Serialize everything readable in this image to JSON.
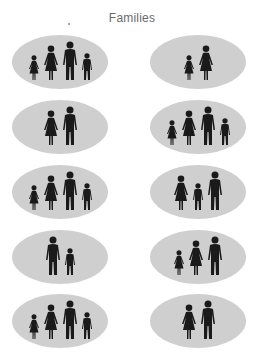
{
  "title": "Families",
  "colors": {
    "oval": "#cfcfcf",
    "figure": "#1a1a1a",
    "title": "#6a6a6a"
  },
  "families": [
    {
      "members": [
        "girl",
        "woman",
        "man",
        "boy"
      ]
    },
    {
      "members": [
        "girl",
        "woman"
      ]
    },
    {
      "members": [
        "woman",
        "man"
      ]
    },
    {
      "members": [
        "girl",
        "woman",
        "man",
        "boy"
      ]
    },
    {
      "members": [
        "girl",
        "woman",
        "man",
        "boy"
      ]
    },
    {
      "members": [
        "woman",
        "boy",
        "man"
      ]
    },
    {
      "members": [
        "man",
        "boy"
      ]
    },
    {
      "members": [
        "girl",
        "woman",
        "man"
      ]
    },
    {
      "members": [
        "girl",
        "woman",
        "man",
        "boy"
      ]
    },
    {
      "members": [
        "woman",
        "man"
      ]
    }
  ]
}
